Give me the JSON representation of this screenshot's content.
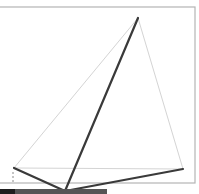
{
  "diagram": {
    "type": "geometry-sketch",
    "frame": {
      "left": -2,
      "top": 7,
      "right": 195,
      "bottom": 183,
      "color": "#b4b4b4"
    },
    "points": {
      "apex": [
        138,
        18
      ],
      "left_base": [
        14,
        168
      ],
      "right_base": [
        183,
        169
      ],
      "bottom": [
        65,
        191
      ]
    },
    "light_edges": [
      {
        "from": "apex",
        "to": "left_base"
      },
      {
        "from": "apex",
        "to": "right_base"
      },
      {
        "from": "left_base",
        "to": "right_base"
      }
    ],
    "dark_edges": [
      {
        "from": "apex",
        "to": "bottom"
      },
      {
        "from": "left_base",
        "to": "bottom"
      },
      {
        "from": "right_base",
        "to": "bottom"
      }
    ],
    "dashed_segment": {
      "x": 13,
      "y1": 172,
      "y2": 182
    },
    "bottom_bar": {
      "x1": 0,
      "x2": 107,
      "y": 189,
      "height": 5,
      "dark_part_end": 15
    },
    "colors": {
      "light_line": "#d4d4d4",
      "dark_line": "#3a3a3a",
      "frame": "#b4b4b4",
      "bar_dark": "#1e1e1e",
      "bar": "#555555"
    }
  }
}
